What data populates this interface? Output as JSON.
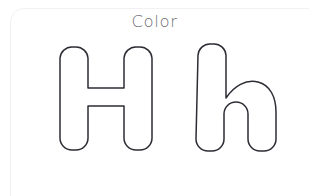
{
  "page": {
    "kind": "coloring-worksheet",
    "background_color": "#ffffff",
    "card_border_color": "#f1f1f4",
    "width": 309,
    "height": 196
  },
  "header": {
    "title": "Color",
    "title_color": "#6f6f74"
  },
  "letters": {
    "outline_color": "#2c2c34",
    "fill_color": "#ffffff",
    "stroke_width": 1.5,
    "items": [
      {
        "character": "H",
        "case": "uppercase",
        "label": "uppercase-letter-h",
        "bounds": {
          "x": 60,
          "y": 47,
          "width": 92,
          "height": 103
        },
        "stem_width": 24,
        "cap_radius": 11,
        "crossbar_top": 92,
        "crossbar_bottom": 108
      },
      {
        "character": "h",
        "case": "lowercase",
        "label": "lowercase-letter-h",
        "bounds": {
          "x": 198,
          "y": 43,
          "width": 74,
          "height": 107
        },
        "stem_width": 24,
        "cap_radius": 11,
        "shoulder_start": 95
      }
    ]
  }
}
